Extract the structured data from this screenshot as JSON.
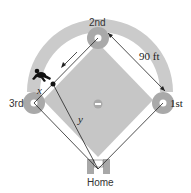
{
  "diagram": {
    "type": "baseball-diamond",
    "bases": {
      "second": "2nd",
      "first": "1st",
      "third": "3rd",
      "home": "Home"
    },
    "side_length_label": "90 ft",
    "variables": {
      "x": "x",
      "y": "y"
    },
    "colors": {
      "outfield_arc": "#c8c8c8",
      "infield": "#c4c4c4",
      "base_circle": "#a9a9a9",
      "base_line": "#ffffff",
      "lines": "#222222",
      "background": "#ffffff"
    }
  }
}
